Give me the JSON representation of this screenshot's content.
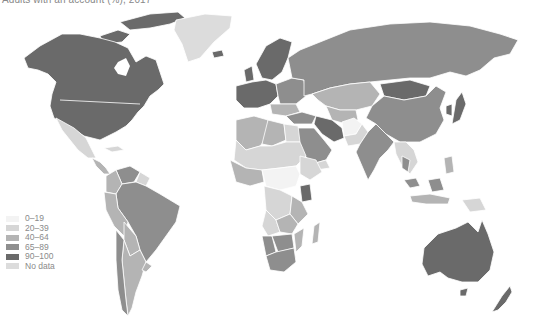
{
  "title": "Adults with an account (%), 2017",
  "legend": {
    "items": [
      {
        "label": "0–19",
        "color": "#f3f3f3"
      },
      {
        "label": "20–39",
        "color": "#d6d6d6"
      },
      {
        "label": "40–64",
        "color": "#b4b4b4"
      },
      {
        "label": "65–89",
        "color": "#8e8e8e"
      },
      {
        "label": "90–100",
        "color": "#6a6a6a"
      },
      {
        "label": "No data",
        "color": "#dcdcdc"
      }
    ]
  },
  "colors": {
    "background": "#ffffff",
    "border": "#ffffff"
  },
  "regions": [
    {
      "name": "North America (US/Canada)",
      "class": "90–100"
    },
    {
      "name": "Mexico",
      "class": "20–39"
    },
    {
      "name": "Greenland",
      "class": "No data"
    },
    {
      "name": "Brazil",
      "class": "65–89"
    },
    {
      "name": "Venezuela",
      "class": "65–89"
    },
    {
      "name": "Argentina/Chile/Peru",
      "class": "40–64"
    },
    {
      "name": "Europe (West/North)",
      "class": "90–100"
    },
    {
      "name": "Russia",
      "class": "65–89"
    },
    {
      "name": "Kazakhstan/Central Asia",
      "class": "40–64"
    },
    {
      "name": "Mongolia",
      "class": "90–100"
    },
    {
      "name": "China",
      "class": "65–89"
    },
    {
      "name": "India",
      "class": "65–89"
    },
    {
      "name": "Iran",
      "class": "90–100"
    },
    {
      "name": "Saudi Arabia",
      "class": "65–89"
    },
    {
      "name": "Afghanistan",
      "class": "0–19"
    },
    {
      "name": "Southeast Asia",
      "class": "20–39"
    },
    {
      "name": "Australia",
      "class": "90–100"
    },
    {
      "name": "New Zealand",
      "class": "90–100"
    },
    {
      "name": "North Africa",
      "class": "20–39"
    },
    {
      "name": "Central Africa",
      "class": "0–19"
    },
    {
      "name": "East Africa (Kenya)",
      "class": "65–89"
    },
    {
      "name": "Southern Africa",
      "class": "65–89"
    }
  ]
}
